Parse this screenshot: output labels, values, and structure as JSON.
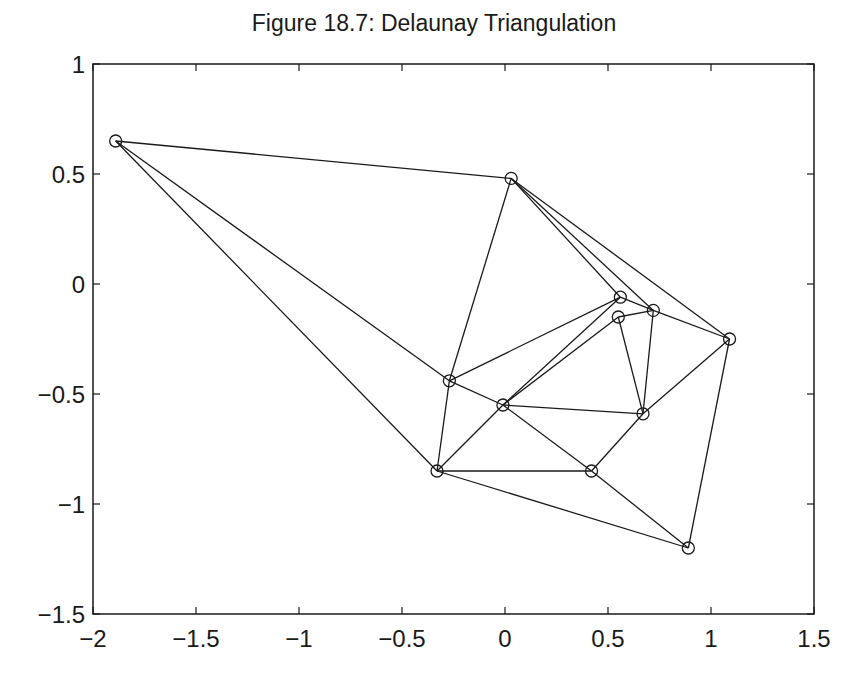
{
  "chart_data": {
    "type": "scatter",
    "title": "Figure 18.7: Delaunay Triangulation",
    "xlabel": "",
    "ylabel": "",
    "xlim": [
      -2,
      1.5
    ],
    "ylim": [
      -1.5,
      1
    ],
    "xticks": [
      -2,
      -1.5,
      -1,
      -0.5,
      0,
      0.5,
      1,
      1.5
    ],
    "xtick_labels": [
      "−2",
      "−1.5",
      "−1",
      "−0.5",
      "0",
      "0.5",
      "1",
      "1.5"
    ],
    "yticks": [
      1,
      0.5,
      0,
      -0.5,
      -1,
      -1.5
    ],
    "ytick_labels": [
      "1",
      "0.5",
      "0",
      "−0.5",
      "−1",
      "−1.5"
    ],
    "grid": false,
    "legend": null,
    "marker": "circle",
    "points": [
      {
        "id": "A",
        "x": -1.89,
        "y": 0.65
      },
      {
        "id": "B",
        "x": 0.03,
        "y": 0.48
      },
      {
        "id": "C",
        "x": 0.56,
        "y": -0.06
      },
      {
        "id": "D",
        "x": 0.55,
        "y": -0.15
      },
      {
        "id": "E",
        "x": 0.72,
        "y": -0.12
      },
      {
        "id": "F",
        "x": 1.09,
        "y": -0.25
      },
      {
        "id": "G",
        "x": -0.27,
        "y": -0.44
      },
      {
        "id": "H",
        "x": -0.01,
        "y": -0.55
      },
      {
        "id": "I",
        "x": -0.33,
        "y": -0.85
      },
      {
        "id": "J",
        "x": 0.67,
        "y": -0.59
      },
      {
        "id": "K",
        "x": 0.42,
        "y": -0.85
      },
      {
        "id": "L",
        "x": 0.89,
        "y": -1.2
      }
    ],
    "edges": [
      [
        "A",
        "B"
      ],
      [
        "A",
        "G"
      ],
      [
        "A",
        "I"
      ],
      [
        "B",
        "G"
      ],
      [
        "B",
        "C"
      ],
      [
        "B",
        "E"
      ],
      [
        "B",
        "F"
      ],
      [
        "C",
        "E"
      ],
      [
        "C",
        "G"
      ],
      [
        "C",
        "H"
      ],
      [
        "D",
        "E"
      ],
      [
        "D",
        "H"
      ],
      [
        "D",
        "J"
      ],
      [
        "E",
        "J"
      ],
      [
        "E",
        "F"
      ],
      [
        "F",
        "J"
      ],
      [
        "F",
        "L"
      ],
      [
        "G",
        "H"
      ],
      [
        "G",
        "I"
      ],
      [
        "H",
        "I"
      ],
      [
        "H",
        "J"
      ],
      [
        "H",
        "K"
      ],
      [
        "I",
        "K"
      ],
      [
        "I",
        "L"
      ],
      [
        "K",
        "J"
      ],
      [
        "K",
        "L"
      ]
    ]
  },
  "colors": {
    "line": "#1a1a1a",
    "background": "#ffffff"
  }
}
